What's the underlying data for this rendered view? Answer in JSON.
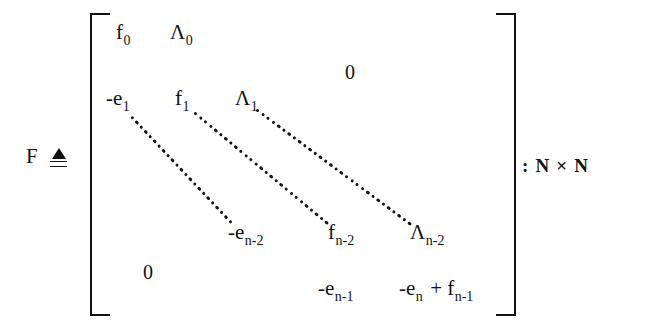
{
  "figure": {
    "kind": "matrix-definition",
    "variable": "F",
    "definition_symbol": "≜",
    "dimension_annotation": ": N × N"
  },
  "matrix": {
    "bracket_style": "square",
    "zeros": [
      {
        "label": "0",
        "corner": "upper-right"
      },
      {
        "label": "0",
        "corner": "lower-left"
      }
    ],
    "rows": [
      {
        "name": "row-first",
        "entries": [
          {
            "base": "f",
            "sub": "0",
            "text": "f"
          },
          {
            "base": "Λ",
            "sub": "0",
            "text": "Λ"
          }
        ]
      },
      {
        "name": "row-second",
        "entries": [
          {
            "base": "-e",
            "sub": "1",
            "text": "-e"
          },
          {
            "base": "f",
            "sub": "1",
            "text": "f"
          },
          {
            "base": "Λ",
            "sub": "1",
            "text": "Λ"
          }
        ]
      },
      {
        "name": "row-penultimate",
        "entries": [
          {
            "base": "-e",
            "sub": "n-2",
            "text": "-e"
          },
          {
            "base": "f",
            "sub": "n-2",
            "text": "f"
          },
          {
            "base": "Λ",
            "sub": "n-2",
            "text": "Λ"
          }
        ]
      },
      {
        "name": "row-last",
        "entries": [
          {
            "base": "-e",
            "sub": "n-1",
            "text": "-e"
          },
          {
            "base": "-e",
            "sub": "n",
            "text": "-e"
          },
          {
            "base": "+",
            "sub": "",
            "text": "+"
          },
          {
            "base": "f",
            "sub": "n-1",
            "text": "f"
          }
        ]
      }
    ],
    "ellipses": [
      {
        "name": "subdiagonal-dots",
        "from": "-e_1",
        "to": "-e_n-2"
      },
      {
        "name": "diagonal-dots",
        "from": "f_1",
        "to": "f_n-2"
      },
      {
        "name": "superdiagonal-dots",
        "from": "Λ_1",
        "to": "Λ_n-2"
      }
    ]
  },
  "cells": {
    "f0_base": "f",
    "f0_sub": "0",
    "L0_base": "Λ",
    "L0_sub": "0",
    "zero_top": "0",
    "e1_base": "-e",
    "e1_sub": "1",
    "f1_base": "f",
    "f1_sub": "1",
    "L1_base": "Λ",
    "L1_sub": "1",
    "en2_base": "-e",
    "en2_sub": "n-2",
    "fn2_base": "f",
    "fn2_sub": "n-2",
    "Ln2_base": "Λ",
    "Ln2_sub": "n-2",
    "zero_bottom": "0",
    "en1_base": "-e",
    "en1_sub": "n-1",
    "en_base": "-e",
    "en_sub": "n",
    "plus": "+",
    "fn1_base": "f",
    "fn1_sub": "n-1",
    "F": "F",
    "dim": ": N × N"
  },
  "style": {
    "ink": "#111111",
    "paper": "#ffffff"
  }
}
